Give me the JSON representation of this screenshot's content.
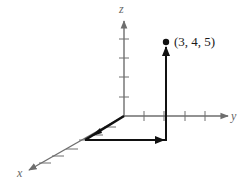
{
  "diagram": {
    "type": "3d-coordinate-system",
    "axes": {
      "x": {
        "label": "x"
      },
      "y": {
        "label": "y"
      },
      "z": {
        "label": "z"
      }
    },
    "point": {
      "label": "(3, 4, 5)",
      "coords": [
        3,
        4,
        5
      ]
    },
    "path_description": "Vector path from origin: 3 units along x, 4 units along y, 5 units along z",
    "colors": {
      "axis": "#6e6e6e",
      "vector": "#111111",
      "background": "#ffffff"
    }
  }
}
